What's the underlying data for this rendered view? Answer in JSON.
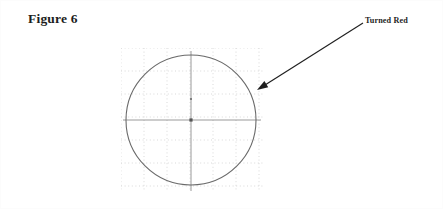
{
  "figure": {
    "title": "Figure 6",
    "width": 443,
    "height": 209,
    "background_color": "#ffffff"
  },
  "annotation": {
    "label": "Turned Red",
    "leader_line": {
      "from_x": 362,
      "from_y": 22,
      "to_x": 256,
      "to_y": 89
    },
    "arrowhead": "solid-triangle",
    "color": "#1f1f1f"
  },
  "shape": {
    "name": "circle",
    "center_x": 190,
    "center_y": 119,
    "radius": 65,
    "stroke_color": "#6a6a6a",
    "stroke_width": 1.1,
    "fill": "none"
  },
  "center_marker": {
    "name": "center-point",
    "x": 190,
    "y": 119,
    "size": 3.2,
    "color": "#555555"
  },
  "upper_marker": {
    "name": "upper-point",
    "x": 190,
    "y": 98,
    "size": 1.8,
    "color": "#6e6e6e"
  },
  "centerlines": {
    "color": "#8f8f8f",
    "stroke_width": 0.9,
    "horizontal": {
      "x1": 122,
      "y1": 119,
      "x2": 260,
      "y2": 119
    },
    "vertical": {
      "x1": 190,
      "y1": 50,
      "x2": 190,
      "y2": 190
    }
  },
  "grid": {
    "visible": true,
    "style": "dotted",
    "color": "#cfcfcf",
    "spacing": 23,
    "x_start": 120,
    "x_end": 263,
    "y_start": 47,
    "y_end": 191,
    "vertical_lines": [
      120,
      143,
      166,
      189,
      212,
      235,
      258
    ],
    "horizontal_lines": [
      47,
      70,
      93,
      116,
      139,
      162,
      185
    ]
  }
}
